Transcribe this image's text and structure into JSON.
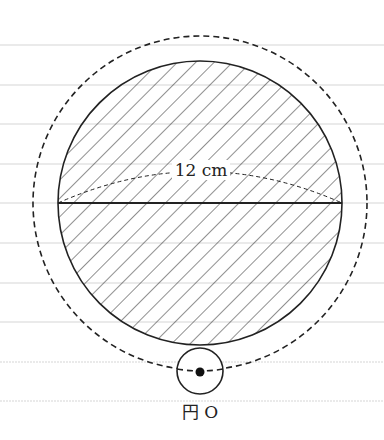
{
  "diagram": {
    "dimension_label": "12 cm",
    "point_label": "円 O",
    "colors": {
      "stroke": "#222222",
      "ruled_line": "#d8d8d8",
      "background": "#ffffff"
    },
    "shapes": {
      "main_circle": {
        "cx": 200,
        "cy": 203,
        "r": 142,
        "fill": "hatched"
      },
      "dashed_path_circle": {
        "cx": 200,
        "cy": 203,
        "r": 167,
        "style": "dashed"
      },
      "small_circle": {
        "cx": 200,
        "cy": 371,
        "r": 23
      },
      "center_point": {
        "cx": 200,
        "cy": 371
      },
      "diameter": {
        "x1": 58,
        "y1": 203,
        "x2": 342,
        "y2": 203
      }
    },
    "ruled_lines_y": [
      45,
      85,
      124,
      164,
      203,
      243,
      283,
      322,
      362,
      401
    ]
  }
}
